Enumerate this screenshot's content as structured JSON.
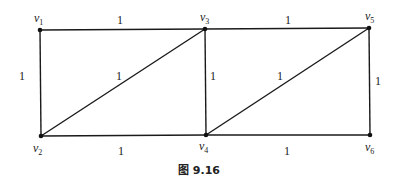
{
  "diagram": {
    "type": "weighted-graph",
    "caption": "图 9.16",
    "vertices": [
      {
        "id": "v1",
        "name": "v",
        "sub": "1",
        "x": 40,
        "y": 30,
        "lx": 34,
        "ly": 22
      },
      {
        "id": "v2",
        "name": "v",
        "sub": "2",
        "x": 41,
        "y": 136,
        "lx": 33,
        "ly": 152
      },
      {
        "id": "v3",
        "name": "v",
        "sub": "3",
        "x": 205,
        "y": 29,
        "lx": 200,
        "ly": 21
      },
      {
        "id": "v4",
        "name": "v",
        "sub": "4",
        "x": 206,
        "y": 135,
        "lx": 199,
        "ly": 150
      },
      {
        "id": "v5",
        "name": "v",
        "sub": "5",
        "x": 369,
        "y": 28,
        "lx": 365,
        "ly": 20
      },
      {
        "id": "v6",
        "name": "v",
        "sub": "6",
        "x": 370,
        "y": 135,
        "lx": 365,
        "ly": 151
      }
    ],
    "edges": [
      {
        "from": "v1",
        "to": "v3",
        "weight": "1",
        "lx": 120,
        "ly": 24
      },
      {
        "from": "v1",
        "to": "v2",
        "weight": "1",
        "lx": 22,
        "ly": 80
      },
      {
        "from": "v2",
        "to": "v3",
        "weight": "1",
        "lx": 119,
        "ly": 80
      },
      {
        "from": "v2",
        "to": "v4",
        "weight": "1",
        "lx": 121,
        "ly": 155
      },
      {
        "from": "v3",
        "to": "v4",
        "weight": "1",
        "lx": 213,
        "ly": 80
      },
      {
        "from": "v3",
        "to": "v5",
        "weight": "1",
        "lx": 288,
        "ly": 24
      },
      {
        "from": "v4",
        "to": "v5",
        "weight": "1",
        "lx": 280,
        "ly": 80
      },
      {
        "from": "v4",
        "to": "v6",
        "weight": "1",
        "lx": 287,
        "ly": 155
      },
      {
        "from": "v5",
        "to": "v6",
        "weight": "1",
        "lx": 378,
        "ly": 85
      }
    ]
  }
}
